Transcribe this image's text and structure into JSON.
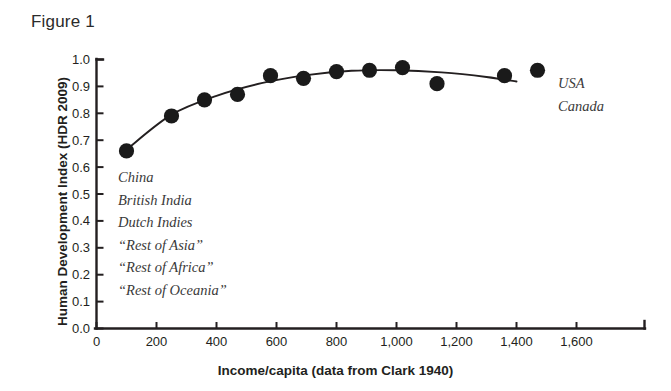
{
  "figure": {
    "label": "Figure 1"
  },
  "chart_data": {
    "type": "scatter",
    "title": "Figure 1",
    "xlabel": "Income/capita (data from Clark 1940)",
    "ylabel": "Human Development Index (HDR 2009)",
    "xlim": [
      0,
      1600
    ],
    "ylim": [
      0.0,
      1.0
    ],
    "grid": false,
    "legend": "none",
    "xticks": [
      0,
      200,
      400,
      600,
      800,
      1000,
      1200,
      1400,
      1600
    ],
    "xticklabels": [
      "0",
      "200",
      "400",
      "600",
      "800",
      "1,000",
      "1,200",
      "1,400",
      "1,600"
    ],
    "yticks": [
      0.0,
      0.1,
      0.2,
      0.3,
      0.4,
      0.5,
      0.6,
      0.7,
      0.8,
      0.9,
      1.0
    ],
    "yticklabels": [
      "0.0",
      "0.1",
      "0.2",
      "0.3",
      "0.4",
      "0.5",
      "0.6",
      "0.7",
      "0.8",
      "0.9",
      "1.0"
    ],
    "x": [
      100,
      250,
      360,
      470,
      580,
      690,
      800,
      910,
      1020,
      1135,
      1360,
      1470
    ],
    "y": [
      0.66,
      0.79,
      0.85,
      0.87,
      0.94,
      0.93,
      0.955,
      0.96,
      0.97,
      0.91,
      0.94,
      0.96
    ],
    "series": [
      {
        "name": "HDR 2009 vs income/capita",
        "marker": "filled-circle",
        "color": "#1a1a1a",
        "values": [
          0.66,
          0.79,
          0.85,
          0.87,
          0.94,
          0.93,
          0.955,
          0.96,
          0.97,
          0.91,
          0.94,
          0.96
        ]
      }
    ],
    "fit_curve": {
      "name": "quadratic trend line",
      "color": "#231f20",
      "x": [
        100,
        250,
        400,
        550,
        700,
        850,
        1000,
        1150,
        1300,
        1400
      ],
      "y": [
        0.665,
        0.795,
        0.865,
        0.912,
        0.942,
        0.958,
        0.96,
        0.952,
        0.935,
        0.918
      ]
    },
    "annotations": {
      "left_group": [
        "China",
        "British India",
        "Dutch Indies",
        "“Rest of Asia”",
        "“Rest of Africa”",
        "“Rest of Oceania”"
      ],
      "right_group": [
        "USA",
        "Canada"
      ]
    }
  }
}
